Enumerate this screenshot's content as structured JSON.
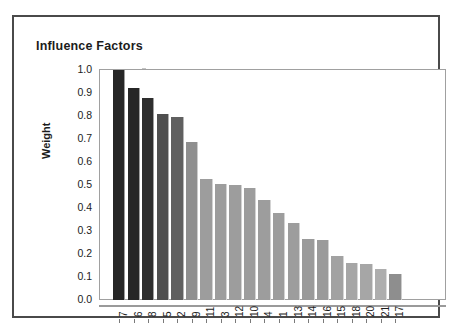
{
  "chart_data": {
    "type": "bar",
    "title": "Influence Factors",
    "xlabel": "",
    "ylabel": "Weight",
    "ylim": [
      0.0,
      1.0
    ],
    "grid": false,
    "legend": null,
    "categories": [
      "7",
      "6",
      "8",
      "5",
      "2",
      "9",
      "11",
      "3",
      "12",
      "10",
      "4",
      "1",
      "13",
      "14",
      "16",
      "15",
      "18",
      "20",
      "21",
      "17"
    ],
    "values": [
      1.0,
      0.92,
      0.88,
      0.81,
      0.795,
      0.685,
      0.525,
      0.505,
      0.5,
      0.485,
      0.435,
      0.38,
      0.335,
      0.265,
      0.26,
      0.19,
      0.16,
      0.155,
      0.135,
      0.115
    ],
    "bar_colors": [
      "#262626",
      "#262626",
      "#2e2e2e",
      "#4f4f4f",
      "#606060",
      "#8f8f8f",
      "#9d9d9d",
      "#9d9d9d",
      "#9d9d9d",
      "#9d9d9d",
      "#9d9d9d",
      "#9d9d9d",
      "#9d9d9d",
      "#9a9a9a",
      "#9a9a9a",
      "#a2a2a2",
      "#a6a6a6",
      "#a6a6a6",
      "#aeaeae",
      "#8e8e8e"
    ],
    "y_ticks": [
      "1.0",
      "0.9",
      "0.8",
      "0.7",
      "0.6",
      "0.5",
      "0.4",
      "0.3",
      "0.2",
      "0.1",
      "0.0"
    ],
    "y_tick_values": [
      1.0,
      0.9,
      0.8,
      0.7,
      0.6,
      0.5,
      0.4,
      0.3,
      0.2,
      0.1,
      0.0
    ]
  }
}
